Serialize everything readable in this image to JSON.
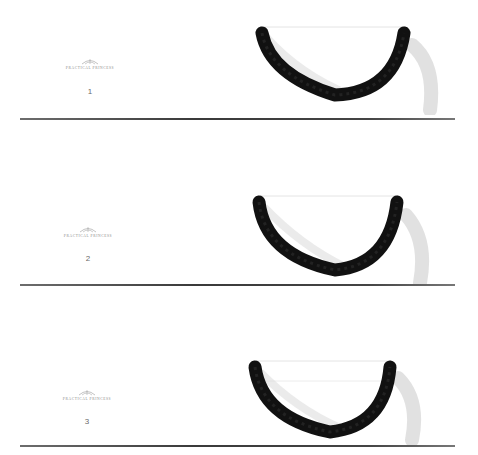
{
  "brand": "PRACTICAL PRINCESS",
  "colors": {
    "rope": "#111111",
    "rule": "#3a3a3a",
    "shadow": "#b8b8b8"
  },
  "panels": [
    {
      "number": "1"
    },
    {
      "number": "2"
    },
    {
      "number": "3"
    }
  ]
}
